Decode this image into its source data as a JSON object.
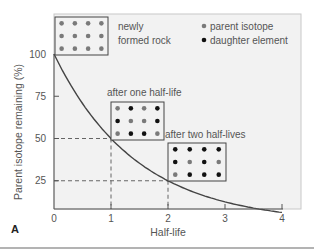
{
  "figure_label": "A",
  "colors": {
    "plot_bg": "#f2f2f2",
    "frame": "#c8c8c8",
    "curve": "#444444",
    "parent": "#7a7a7a",
    "daughter": "#111111",
    "guide": "#555555",
    "bottom_rule": "#9a9a9a"
  },
  "legend": {
    "items": [
      {
        "label": "parent isotope",
        "color": "#7a7a7a"
      },
      {
        "label": "daughter element",
        "color": "#111111"
      }
    ]
  },
  "annotations": [
    {
      "id": "newly",
      "lines": [
        "newly",
        "formed rock"
      ],
      "grid": [
        [
          "p",
          "p",
          "p",
          "p"
        ],
        [
          "p",
          "p",
          "p",
          "p"
        ],
        [
          "p",
          "p",
          "p",
          "p"
        ]
      ]
    },
    {
      "id": "one",
      "lines": [
        "after one half-life"
      ],
      "grid": [
        [
          "p",
          "d",
          "p",
          "d"
        ],
        [
          "d",
          "p",
          "p",
          "d"
        ],
        [
          "p",
          "d",
          "d",
          "p"
        ]
      ]
    },
    {
      "id": "two",
      "lines": [
        "after two half-lives"
      ],
      "grid": [
        [
          "d",
          "d",
          "d",
          "d"
        ],
        [
          "d",
          "p",
          "d",
          "p"
        ],
        [
          "p",
          "d",
          "d",
          "d"
        ]
      ]
    }
  ],
  "chart_data": {
    "type": "line",
    "title": "",
    "xlabel": "Half-life",
    "ylabel": "Parent isotope remaining (%)",
    "x_ticks": [
      0,
      1,
      2,
      3,
      4
    ],
    "y_ticks": [
      25,
      50,
      75,
      100
    ],
    "xlim": [
      0,
      4
    ],
    "ylim": [
      8,
      100
    ],
    "grid": false,
    "legend_position": "top-right",
    "series": [
      {
        "name": "Parent isotope remaining",
        "x": [
          0,
          0.5,
          1,
          1.5,
          2,
          2.5,
          3,
          3.5,
          4
        ],
        "y": [
          100,
          70.7,
          50,
          35.4,
          25,
          17.7,
          12.5,
          8.8,
          6.25
        ]
      }
    ],
    "guides": [
      {
        "x": 1,
        "y": 50
      },
      {
        "x": 2,
        "y": 25
      }
    ],
    "annotations": [
      "newly formed rock",
      "after one half-life",
      "after two half-lives"
    ]
  }
}
